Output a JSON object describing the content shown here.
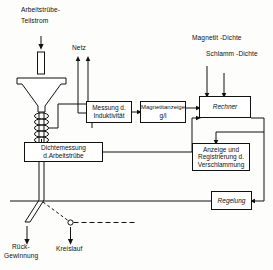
{
  "diagram": {
    "title_note": "Schematische Darstellung der Magnetit-Dichtemessung im Arbeitstrübe-Teilstrom",
    "language": "de"
  },
  "labels": {
    "inflow_line1": "Arbeitstrübe-",
    "inflow_line2": "Teilstrom",
    "mains": "Netz",
    "magnetit_dichte": "Magnetit -Dichte",
    "schlamm_dichte": "Schlamm -Dichte",
    "recovery_line1": "Rück-",
    "recovery_line2": "Gewinnung",
    "circuit": "Kreislauf"
  },
  "boxes": {
    "induktivitaet": {
      "line1": "Messung d.",
      "line2": "Induktivität"
    },
    "magnetitanzeige": {
      "line1": "Magnetitanzeige",
      "line2": "g/l"
    },
    "rechner": {
      "line1": "Rechner"
    },
    "dichtemessung": {
      "line1": "Dichtemessung",
      "line2": "d.Arbeitstrübe"
    },
    "anzeige": {
      "line1": "Anzeige und",
      "line2": "Registrierung d.",
      "line3": "Verschlammung"
    },
    "regelung": {
      "line1": "Regelung"
    }
  },
  "icons": {
    "inflow_arrow": "down-arrow-icon",
    "mains_arrow_left": "up-arrow-icon",
    "mains_arrow_right": "up-arrow-icon",
    "magnetit_arrow": "down-arrow-icon",
    "schlamm_arrow": "down-arrow-icon",
    "recovery_arrow": "down-arrow-icon",
    "circuit_arrow": "down-arrow-icon",
    "funnel": "funnel-icon",
    "coil": "coil-sensor-icon",
    "valve": "valve-junction-icon"
  },
  "colors": {
    "ink": "#111111",
    "paper": "#fdfdfb"
  }
}
